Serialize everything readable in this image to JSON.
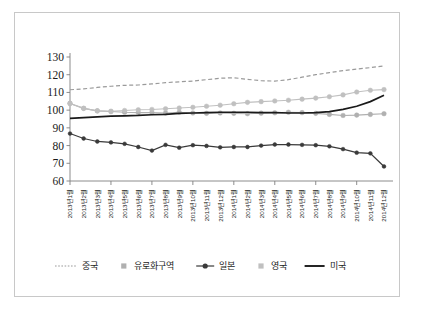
{
  "chart_data": {
    "type": "line",
    "title": "",
    "subtitle": "",
    "xlabel": "",
    "ylabel": "",
    "ylim": [
      60,
      130
    ],
    "ytick_values": [
      60,
      70,
      80,
      90,
      100,
      110,
      120,
      130
    ],
    "ytick_labels": [
      "60",
      "70",
      "80",
      "90",
      "100",
      "110",
      "120",
      "130"
    ],
    "grid": false,
    "legend_position": "bottom",
    "categories": [
      "2013년 1월",
      "2013년 2월",
      "2013년 3월",
      "2013년 4월",
      "2013년 5월",
      "2013년 6월",
      "2013년 7월",
      "2013년 8월",
      "2013년 9월",
      "2013년 10월",
      "2013년 11월",
      "2013년 12월",
      "2014년 1월",
      "2014년 2월",
      "2014년 3월",
      "2014년 4월",
      "2014년 5월",
      "2014년 6월",
      "2014년 7월",
      "2014년 8월",
      "2014년 9월",
      "2014년 10월",
      "2014년 11월",
      "2014년 12월"
    ],
    "series": [
      {
        "name": "중국",
        "style": "dashed",
        "color": "#9a9a9a",
        "marker": "none",
        "values": [
          111.5,
          112.0,
          112.8,
          113.5,
          114.0,
          114.2,
          114.8,
          115.5,
          116.0,
          116.4,
          117.2,
          118.0,
          118.3,
          117.4,
          116.6,
          116.4,
          117.2,
          118.6,
          120.0,
          121.2,
          122.3,
          123.2,
          124.0,
          125.0
        ]
      },
      {
        "name": "유로화구역",
        "style": "solid",
        "color": "#b0b0b0",
        "marker": "circle",
        "values": [
          103.8,
          101.0,
          99.6,
          99.2,
          98.8,
          98.6,
          98.6,
          98.4,
          98.8,
          98.4,
          98.2,
          98.4,
          98.2,
          98.0,
          98.3,
          98.5,
          98.8,
          98.6,
          98.2,
          97.6,
          97.0,
          97.2,
          97.6,
          98.0
        ]
      },
      {
        "name": "일본",
        "style": "solid",
        "color": "#3a3a3a",
        "marker": "circle",
        "values": [
          86.8,
          84.0,
          82.3,
          81.8,
          81.0,
          79.2,
          77.2,
          80.4,
          78.8,
          80.2,
          79.8,
          79.0,
          79.2,
          79.2,
          80.0,
          80.6,
          80.6,
          80.4,
          80.2,
          79.6,
          78.0,
          76.0,
          75.6,
          68.2
        ]
      },
      {
        "name": "영국",
        "style": "solid",
        "color": "#c0c0c0",
        "marker": "circle",
        "values": [
          103.8,
          101.0,
          99.6,
          99.4,
          99.8,
          100.2,
          100.4,
          100.8,
          101.2,
          101.6,
          102.2,
          102.8,
          103.6,
          104.4,
          104.8,
          105.2,
          105.6,
          106.2,
          106.8,
          107.6,
          108.6,
          110.2,
          111.2,
          111.6
        ]
      },
      {
        "name": "미국",
        "style": "solid",
        "color": "#1a1a1a",
        "marker": "none",
        "values": [
          95.4,
          95.8,
          96.2,
          96.6,
          96.8,
          97.0,
          97.4,
          97.6,
          98.2,
          98.4,
          98.6,
          98.8,
          98.8,
          98.8,
          98.6,
          98.6,
          98.4,
          98.4,
          98.6,
          99.2,
          100.4,
          102.2,
          104.8,
          108.4
        ]
      }
    ],
    "legend": [
      {
        "label": "중국",
        "style": "dotted",
        "color": "#9a9a9a",
        "marker": "none"
      },
      {
        "label": "유로화구역",
        "style": "none",
        "color": "#b0b0b0",
        "marker": "square"
      },
      {
        "label": "일본",
        "style": "solid",
        "color": "#3a3a3a",
        "marker": "circle"
      },
      {
        "label": "영국",
        "style": "none",
        "color": "#c0c0c0",
        "marker": "square"
      },
      {
        "label": "미국",
        "style": "solid",
        "color": "#1a1a1a",
        "marker": "none"
      }
    ]
  }
}
